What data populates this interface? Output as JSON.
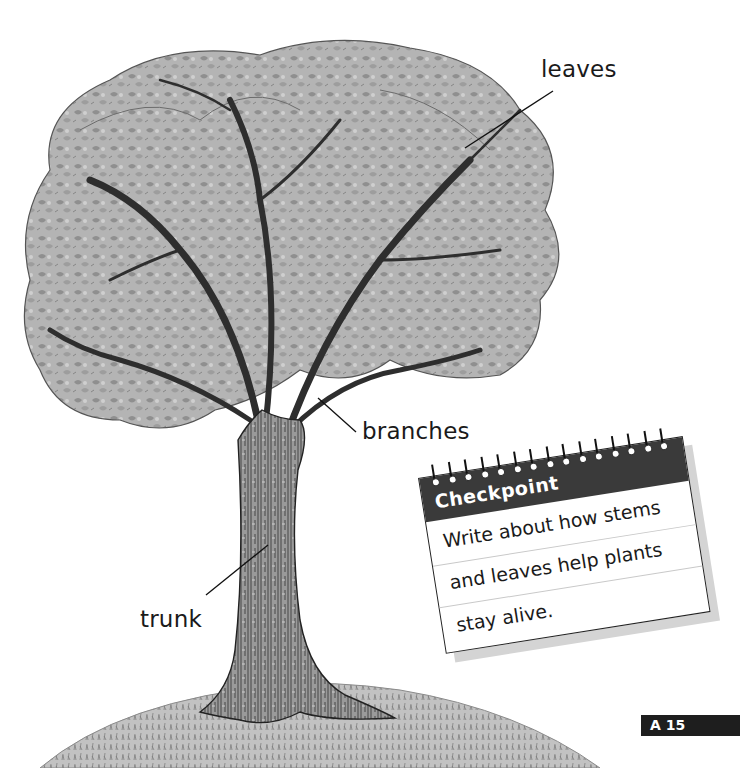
{
  "labels": {
    "leaves": "leaves",
    "branches": "branches",
    "trunk": "trunk"
  },
  "checkpoint": {
    "title": "Checkpoint",
    "lines": [
      "Write about how stems",
      "and leaves help plants",
      "stay alive."
    ],
    "ring_count": 15
  },
  "page_number": "A 15",
  "colors": {
    "ink": "#1a1a1a",
    "header": "#3a3a3a",
    "badge": "#1e1e1e",
    "foliage": "#a8a8a8",
    "grass": "#bdbdbd"
  }
}
